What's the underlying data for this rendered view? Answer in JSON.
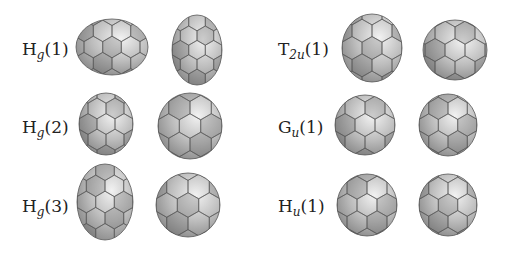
{
  "figure": {
    "panels": [
      {
        "id": "hg1",
        "label_main": "H",
        "label_sub": "g",
        "label_suffix": "(1)",
        "label_pos": [
          22,
          39
        ],
        "shapes": [
          {
            "cx": 112,
            "cy": 47,
            "rx": 36,
            "ry": 28
          },
          {
            "cx": 197,
            "cy": 50,
            "rx": 25,
            "ry": 35
          }
        ]
      },
      {
        "id": "hg2",
        "label_main": "H",
        "label_sub": "g",
        "label_suffix": "(2)",
        "label_pos": [
          22,
          117
        ],
        "shapes": [
          {
            "cx": 106,
            "cy": 124,
            "rx": 27,
            "ry": 31
          },
          {
            "cx": 190,
            "cy": 126,
            "rx": 32,
            "ry": 33
          }
        ]
      },
      {
        "id": "hg3",
        "label_main": "H",
        "label_sub": "g",
        "label_suffix": "(3)",
        "label_pos": [
          22,
          196
        ],
        "shapes": [
          {
            "cx": 105,
            "cy": 202,
            "rx": 28,
            "ry": 38
          },
          {
            "cx": 188,
            "cy": 205,
            "rx": 32,
            "ry": 32
          }
        ]
      },
      {
        "id": "t2u1",
        "label_main": "T",
        "label_sub": "2u",
        "label_suffix": "(1)",
        "label_pos": [
          278,
          39
        ],
        "shapes": [
          {
            "cx": 372,
            "cy": 48,
            "rx": 30,
            "ry": 34
          },
          {
            "cx": 455,
            "cy": 50,
            "rx": 32,
            "ry": 30
          }
        ]
      },
      {
        "id": "gu1",
        "label_main": "G",
        "label_sub": "u",
        "label_suffix": "(1)",
        "label_pos": [
          278,
          117
        ],
        "shapes": [
          {
            "cx": 365,
            "cy": 125,
            "rx": 30,
            "ry": 30
          },
          {
            "cx": 448,
            "cy": 125,
            "rx": 29,
            "ry": 31
          }
        ]
      },
      {
        "id": "hu1",
        "label_main": "H",
        "label_sub": "u",
        "label_suffix": "(1)",
        "label_pos": [
          278,
          196
        ],
        "shapes": [
          {
            "cx": 367,
            "cy": 205,
            "rx": 30,
            "ry": 31
          },
          {
            "cx": 448,
            "cy": 205,
            "rx": 29,
            "ry": 31
          }
        ]
      }
    ],
    "colors": {
      "light": "#f2f2f2",
      "mid": "#bdbdbd",
      "dark": "#7c7c7c",
      "edge": "#555555"
    }
  }
}
